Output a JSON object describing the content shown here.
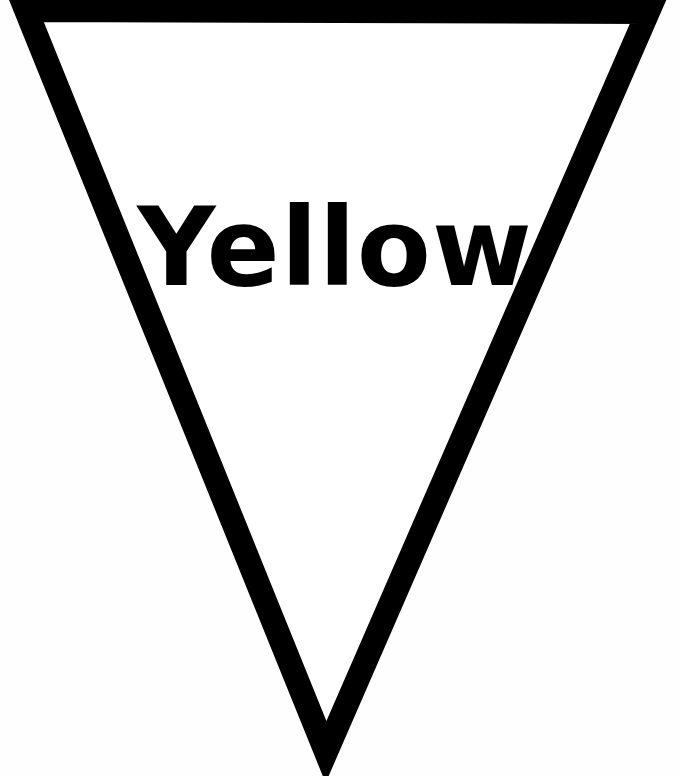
{
  "pennant": {
    "label": "Yellow",
    "stroke_color": "#000000",
    "fill_color": "#ffffff",
    "shape": "inverted-triangle"
  }
}
